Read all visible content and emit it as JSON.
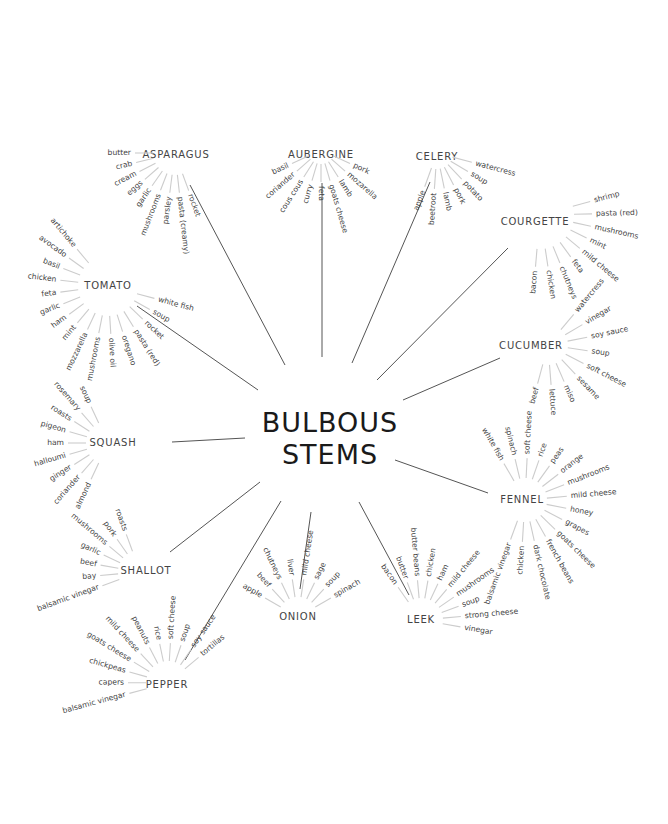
{
  "title": {
    "line1": "BULBOUS",
    "line2": "STEMS",
    "x": 330,
    "y1": 432,
    "y2": 464
  },
  "colors": {
    "background": "#ffffff",
    "text": "#1a1a1a",
    "label": "#444444",
    "connector": "#555555",
    "tick": "#cccccc"
  },
  "vegetables": [
    {
      "name": "ASPARAGUS",
      "lx": 176,
      "ly": 158,
      "anchor": "middle",
      "line": [
        190,
        185,
        285,
        365
      ],
      "hub": [
        175,
        153
      ],
      "r_in": 22,
      "r_out": 40,
      "r_text": 44,
      "start": 180,
      "end": 290,
      "pairings": [
        "butter",
        "crab",
        "cream",
        "eggs",
        "garlic",
        "mushrooms",
        "parsley",
        "pasta (creamy)",
        "rocket"
      ]
    },
    {
      "name": "AUBERGINE",
      "lx": 321,
      "ly": 158,
      "anchor": "middle",
      "line": [
        322,
        183,
        322,
        357
      ],
      "hub": [
        321,
        150
      ],
      "r_in": 14,
      "r_out": 32,
      "r_text": 36,
      "start": 205,
      "end": 335,
      "pairings": [
        "basil",
        "coriander",
        "cous cous",
        "curry",
        "feta",
        "goats cheese",
        "lamb",
        "mozarella",
        "pork"
      ]
    },
    {
      "name": "CELERY",
      "lx": 437,
      "ly": 160,
      "anchor": "middle",
      "line": [
        430,
        182,
        352,
        363
      ],
      "hub": [
        437,
        153
      ],
      "r_in": 16,
      "r_out": 36,
      "r_text": 40,
      "start": 250,
      "end": 345,
      "pairings": [
        "apple",
        "beetroot",
        "lamb",
        "pork",
        "potato",
        "soup",
        "watercress"
      ]
    },
    {
      "name": "COURGETTE",
      "lx": 535,
      "ly": 225,
      "anchor": "middle",
      "line": [
        508,
        248,
        377,
        380
      ],
      "hub": [
        540,
        215
      ],
      "r_in": 34,
      "r_out": 52,
      "r_text": 56,
      "start": 265,
      "end": 375,
      "pairings": [
        "bacon",
        "chicken",
        "chutneys",
        "feta",
        "mild cheese",
        "mint",
        "mushrooms",
        "pasta (red)",
        "shrimp"
      ]
    },
    {
      "name": "TOMATO",
      "lx": 108,
      "ly": 289,
      "anchor": "middle",
      "line": [
        137,
        306,
        258,
        390
      ],
      "hub": [
        108,
        286
      ],
      "r_in": 30,
      "r_out": 48,
      "r_text": 52,
      "start": 130,
      "end": 345,
      "pairings": [
        "artichoke",
        "avocado",
        "basil",
        "chicken",
        "feta",
        "garlic",
        "ham",
        "mint",
        "mozzarella",
        "mushrooms",
        "olive oil",
        "oregano",
        "pasta (red)",
        "rocket",
        "soup",
        "white fish"
      ]
    },
    {
      "name": "CUCUMBER",
      "lx": 531,
      "ly": 349,
      "anchor": "middle",
      "line": [
        500,
        358,
        403,
        400
      ],
      "hub": [
        548,
        345
      ],
      "r_in": 20,
      "r_out": 40,
      "r_text": 44,
      "start": 255,
      "end": 410,
      "pairings": [
        "beef",
        "lettuce",
        "miso",
        "sesame",
        "soft cheese",
        "soup",
        "soy sauce",
        "vinegar",
        "watercress"
      ]
    },
    {
      "name": "SQUASH",
      "lx": 113,
      "ly": 446,
      "anchor": "middle",
      "line": [
        172,
        442,
        245,
        438
      ],
      "hub": [
        108,
        443
      ],
      "r_in": 22,
      "r_out": 40,
      "r_text": 44,
      "start": 115,
      "end": 245,
      "pairings": [
        "soup",
        "rosemary",
        "roasts",
        "pigeon",
        "ham",
        "halloumi",
        "ginger",
        "coriander",
        "almond"
      ]
    },
    {
      "name": "FENNEL",
      "lx": 522,
      "ly": 503,
      "anchor": "middle",
      "line": [
        395,
        460,
        488,
        493
      ],
      "hub": [
        525,
        500
      ],
      "r_in": 22,
      "r_out": 42,
      "r_text": 46,
      "start": 250,
      "end": 480,
      "pairings": [
        "balsamic vinegar",
        "chicken",
        "dark chocolate",
        "french beans",
        "goats cheese",
        "grapes",
        "honey",
        "mild cheese",
        "mushrooms",
        "orange",
        "peas",
        "rice",
        "soft cheese",
        "spinach",
        "white fish"
      ]
    },
    {
      "name": "SHALLOT",
      "lx": 146,
      "ly": 574,
      "anchor": "middle",
      "line": [
        170,
        552,
        260,
        482
      ],
      "hub": [
        140,
        572
      ],
      "r_in": 22,
      "r_out": 40,
      "r_text": 44,
      "start": 110,
      "end": 200,
      "pairings": [
        "roasts",
        "pork",
        "mushrooms",
        "garlic",
        "beef",
        "bay",
        "balsamic vinegar"
      ]
    },
    {
      "name": "PEPPER",
      "lx": 167,
      "ly": 688,
      "anchor": "middle",
      "line": [
        185,
        660,
        281,
        501
      ],
      "hub": [
        168,
        683
      ],
      "r_in": 22,
      "r_out": 40,
      "r_text": 44,
      "start": 40,
      "end": 195,
      "pairings": [
        "tortillas",
        "soy sauce",
        "soup",
        "soft cheese",
        "rice",
        "peanuts",
        "mild cheese",
        "goats cheese",
        "chickpeas",
        "capers",
        "balsamic vinegar"
      ]
    },
    {
      "name": "ONION",
      "lx": 298,
      "ly": 620,
      "anchor": "middle",
      "line": [
        300,
        589,
        311,
        512
      ],
      "hub": [
        298,
        617
      ],
      "r_in": 20,
      "r_out": 38,
      "r_text": 42,
      "start": 30,
      "end": 150,
      "pairings": [
        "spinach",
        "soup",
        "sage",
        "mild cheese",
        "liver",
        "chutneys",
        "beef",
        "apple"
      ]
    },
    {
      "name": "LEEK",
      "lx": 421,
      "ly": 623,
      "anchor": "middle",
      "line": [
        409,
        595,
        359,
        502
      ],
      "hub": [
        421,
        620
      ],
      "r_in": 22,
      "r_out": 40,
      "r_text": 44,
      "start": -10,
      "end": 125,
      "pairings": [
        "vinegar",
        "strong cheese",
        "soup",
        "mushrooms",
        "mild cheese",
        "ham",
        "chicken",
        "butter beans",
        "butter",
        "bacon"
      ]
    }
  ]
}
